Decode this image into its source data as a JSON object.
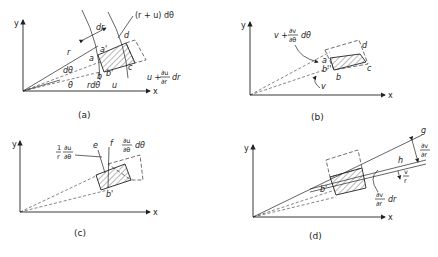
{
  "figure": {
    "panels": [
      {
        "id": "a",
        "caption": "(a)",
        "axis_x": "x",
        "axis_y": "y",
        "labels": {
          "r": "r",
          "dr": "dr",
          "r_plus_u_dtheta": "(r + u) dθ",
          "a": "a",
          "a_prime": "a'",
          "b": "b",
          "b_prime": "b'",
          "c": "c",
          "d": "d",
          "dtheta": "dθ",
          "theta": "θ",
          "r_dtheta": "rdθ",
          "u": "u",
          "u_plus": "u +",
          "du": "∂u",
          "dr_den": "∂r",
          "dr_suffix": "dr"
        }
      },
      {
        "id": "b",
        "caption": "(b)",
        "axis_x": "x",
        "axis_y": "y",
        "labels": {
          "v_plus": "v +",
          "dv": "∂v",
          "dtheta_den": "∂θ",
          "dtheta_suffix": "dθ",
          "a": "a",
          "b_dprime": "b''",
          "b": "b",
          "c": "c",
          "d": "d",
          "v": "v"
        }
      },
      {
        "id": "c",
        "caption": "(c)",
        "axis_x": "x",
        "axis_y": "y",
        "labels": {
          "one": "1",
          "r": "r",
          "du": "∂u",
          "dtheta_den": "∂θ",
          "e": "e",
          "f": "f",
          "du2": "∂u",
          "dtheta_den2": "∂θ",
          "dtheta_suffix": "dθ",
          "b_prime": "b'"
        }
      },
      {
        "id": "d",
        "caption": "(d)",
        "axis_x": "x",
        "axis_y": "y",
        "labels": {
          "g": "g",
          "h": "h",
          "dv": "∂v",
          "dr_den": "∂r",
          "v": "v",
          "r": "r",
          "dv2": "∂v",
          "dr_den2": "∂r",
          "dr_suffix": "dr",
          "b_prime": "b'"
        }
      }
    ]
  }
}
